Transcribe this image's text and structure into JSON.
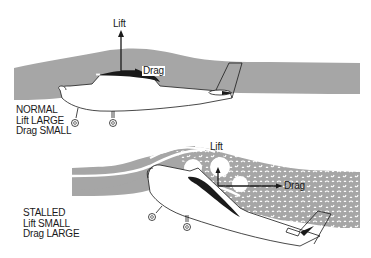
{
  "normal": {
    "title": "NORMAL",
    "lift_text": "Lift LARGE",
    "drag_text": "Drag SMALL",
    "lift_arrow_label": "Lift",
    "drag_arrow_label": "Drag"
  },
  "stalled": {
    "title": "STALLED",
    "lift_text": "Lift SMALL",
    "drag_text": "Drag LARGE",
    "lift_arrow_label": "Lift",
    "drag_arrow_label": "Drag"
  },
  "colors": {
    "airflow": "#a6a6a6",
    "ink": "#1a1a1a",
    "background": "#ffffff"
  }
}
